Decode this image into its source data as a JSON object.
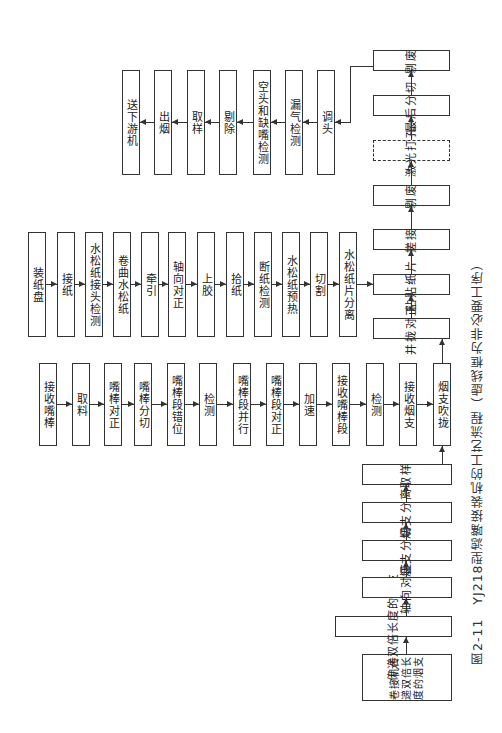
{
  "figure": {
    "caption": "图2-11　YJ218型滤嘴接装机的工艺流程（虚线框为非必要工序）",
    "title": "YJ218型滤嘴接装机的工艺流程",
    "figure_number": "图2-11",
    "note": "虚线框为非必要工序"
  },
  "main_flow": [
    {
      "label": "卷接机传递双倍长度的烟支",
      "lines": [
        "卷接机",
        "传递双",
        "倍长度",
        "的烟支"
      ]
    },
    {
      "label": "传递双倍长度的烟支"
    },
    {
      "label": "轴向对正"
    },
    {
      "label": "烟支分切"
    },
    {
      "label": "烟支分离"
    },
    {
      "label": "取样"
    },
    {
      "label": "烟支吹拢"
    },
    {
      "label": "并拢对正"
    },
    {
      "label": "粘贴纸片"
    },
    {
      "label": "搓接"
    },
    {
      "label": "剔废"
    },
    {
      "label": "激光打孔",
      "optional": true
    },
    {
      "label": "最后分切"
    },
    {
      "label": "剔废"
    }
  ],
  "tip_rod_flow": [
    {
      "label": "接收嘴棒"
    },
    {
      "label": "取料"
    },
    {
      "label": "嘴棒对正"
    },
    {
      "label": "嘴棒分切"
    },
    {
      "label": "嘴棒段错位"
    },
    {
      "label": "检测"
    },
    {
      "label": "嘴棒段并行"
    },
    {
      "label": "嘴棒段对正"
    },
    {
      "label": "加速"
    },
    {
      "label": "接收嘴棒段"
    },
    {
      "label": "检测"
    },
    {
      "label": "接收烟支"
    }
  ],
  "paper_flow": [
    {
      "label": "装纸盘"
    },
    {
      "label": "接纸"
    },
    {
      "label": "水松纸接头检测"
    },
    {
      "label": "卷曲水松纸"
    },
    {
      "label": "牵引"
    },
    {
      "label": "轴向对正"
    },
    {
      "label": "上胶"
    },
    {
      "label": "拾纸"
    },
    {
      "label": "断纸检测"
    },
    {
      "label": "水松纸预热"
    },
    {
      "label": "切割"
    },
    {
      "label": "水松纸片分离"
    }
  ],
  "output_flow": [
    {
      "label": "调头"
    },
    {
      "label": "漏气检测"
    },
    {
      "label": "空头和缺嘴检测"
    },
    {
      "label": "剔除"
    },
    {
      "label": "取样"
    },
    {
      "label": "出烟"
    },
    {
      "label": "送下游机"
    }
  ]
}
